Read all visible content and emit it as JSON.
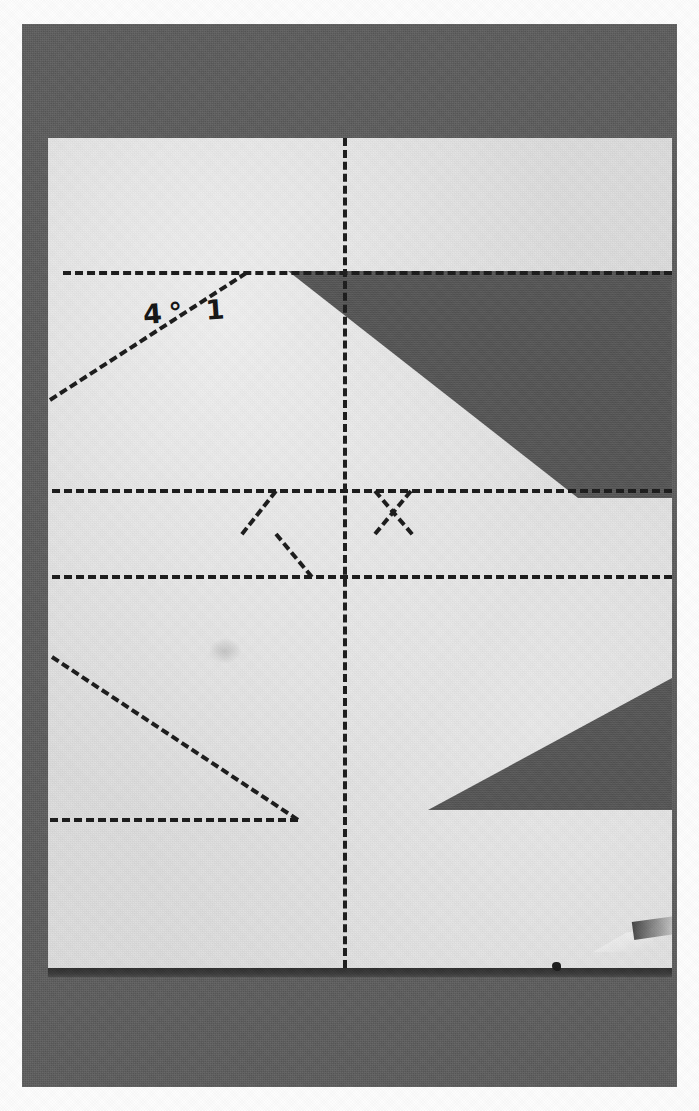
{
  "photo": {
    "subject": "folded-paper-crease-pattern",
    "width": 699,
    "height": 1111,
    "handwritten_label": "4° 1",
    "colors": {
      "photo_border": "#fdfdfd",
      "backdrop": "#5c5c5c",
      "paper": "#dedede",
      "cutout": "#555555",
      "crease_line": "#1b1b1b",
      "bottom_edge_shadow": "#2f2f2f",
      "ink": "#141414"
    }
  },
  "sheet": {
    "label": "paper-sheet",
    "left": 48,
    "top": 138,
    "width": 624,
    "height": 838
  },
  "annotation": {
    "text": "4° 1",
    "left": 95,
    "top": 158,
    "rotation_deg": -4
  },
  "crease_lines": {
    "vertical_center": {
      "name": "vertical-center-crease",
      "x": 343,
      "y_start": 138,
      "y_end": 968,
      "style": "dashed"
    },
    "horizontals": [
      {
        "name": "horizontal-crease-upper",
        "y": 271,
        "x_start": 63,
        "x_end": 672,
        "style": "dashed"
      },
      {
        "name": "horizontal-crease-middle-upper",
        "y": 489,
        "x_start": 52,
        "x_end": 672,
        "style": "dashed"
      },
      {
        "name": "horizontal-crease-middle-lower",
        "y": 575,
        "x_start": 52,
        "x_end": 672,
        "style": "dashed"
      },
      {
        "name": "horizontal-crease-lower",
        "y": 818,
        "x_start": 50,
        "x_end": 298,
        "style": "dashed"
      }
    ],
    "diagonals": [
      {
        "name": "diagonal-crease-upper-left",
        "x1": 50,
        "y1": 398,
        "x2": 246,
        "y2": 271,
        "style": "dashed"
      },
      {
        "name": "diagonal-crease-lower-left",
        "x1": 52,
        "y1": 655,
        "x2": 298,
        "y2": 818,
        "style": "dashed"
      }
    ],
    "bowtie": {
      "name": "bowtie-crease-group",
      "description": "two opposing chevrons between the middle horizontal creases",
      "left_chevron": [
        {
          "x1": 310,
          "y1": 489,
          "x2": 276,
          "y2": 532
        },
        {
          "x1": 276,
          "y1": 532,
          "x2": 312,
          "y2": 575
        }
      ],
      "right_chevron": [
        {
          "x1": 375,
          "y1": 489,
          "x2": 412,
          "y2": 532
        },
        {
          "x1": 412,
          "y1": 532,
          "x2": 376,
          "y2": 575
        }
      ]
    }
  },
  "cutouts": [
    {
      "name": "cutout-upper-band",
      "description": "dark parallelogram band revealing backdrop through the sheet",
      "vertices": [
        [
          425,
          271
        ],
        [
          672,
          271
        ],
        [
          672,
          498
        ],
        [
          578,
          498
        ],
        [
          288,
          271
        ]
      ]
    },
    {
      "name": "cutout-lower-wedge",
      "description": "dark triangular wedge with apex pointing left",
      "vertices": [
        [
          672,
          678
        ],
        [
          672,
          810
        ],
        [
          428,
          810
        ]
      ]
    }
  ],
  "marks": [
    {
      "name": "paper-smudge",
      "left": 208,
      "top": 638
    },
    {
      "name": "dark-speck",
      "left": 600,
      "top": 1100
    },
    {
      "name": "crease-flap",
      "left": 593,
      "top": 928
    }
  ]
}
